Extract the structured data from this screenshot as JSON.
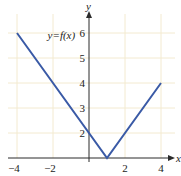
{
  "chart_data": {
    "type": "line",
    "title": "",
    "xlabel": "x",
    "ylabel": "y",
    "xlim": [
      -4.4,
      4.8
    ],
    "ylim": [
      1,
      6.6
    ],
    "x_axis_crosses_y_at": 1,
    "x_ticks": [
      -4,
      -2,
      2,
      4
    ],
    "x_tick_labels": [
      "−4",
      "−2",
      "2",
      "4"
    ],
    "y_ticks": [
      2,
      3,
      4,
      5,
      6
    ],
    "y_tick_labels": [
      "2",
      "3",
      "4",
      "5",
      "6"
    ],
    "x_grid": [
      -4,
      -2,
      2,
      4
    ],
    "y_grid": [
      2,
      3,
      4,
      5,
      6
    ],
    "grid": true,
    "series": [
      {
        "name": "y=f(x)",
        "color": "#3a5aa6",
        "x": [
          -4,
          1,
          4
        ],
        "y": [
          6,
          1,
          4
        ]
      }
    ],
    "annotations": [
      {
        "text": "y=f(x)",
        "x": -2.3,
        "y": 5.75
      }
    ],
    "legend": "none"
  }
}
